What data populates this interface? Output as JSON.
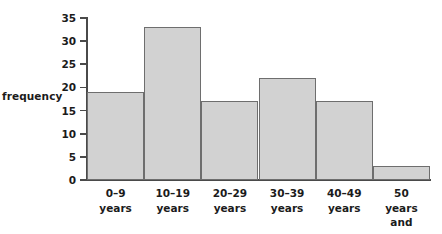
{
  "chart_data": {
    "type": "bar",
    "title": "",
    "subtitle": "",
    "xlabel": "",
    "ylabel": "frequency",
    "categories": [
      "0–9\nyears",
      "10–19\nyears",
      "20–29\nyears",
      "30–39\nyears",
      "40–49\nyears",
      "50\nyears and\nover"
    ],
    "values": [
      19,
      33,
      17,
      22,
      17,
      3
    ],
    "ylim": [
      0,
      35
    ],
    "yticks": [
      0,
      5,
      10,
      15,
      20,
      25,
      30,
      35
    ],
    "ytick_labels": [
      "0",
      "5",
      "10",
      "15",
      "20",
      "25",
      "30",
      "35"
    ],
    "grid": false,
    "legend": false,
    "bar_fill": "#d2d2d2",
    "bar_stroke": "#6e6e6e",
    "axis_color": "#4a4a4a",
    "text_color": "#1b1b1b",
    "background": "#ffffff"
  }
}
